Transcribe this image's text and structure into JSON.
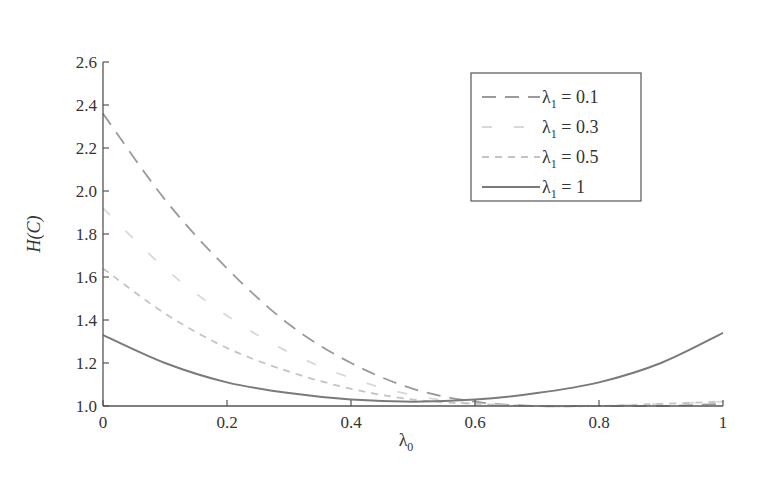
{
  "chart_data": {
    "type": "line",
    "title": "",
    "xlabel": "λ0",
    "ylabel": "H(C)",
    "xlim": [
      0,
      1
    ],
    "ylim": [
      1.0,
      2.6
    ],
    "grid": false,
    "legend_position": "upper right",
    "x_ticks": [
      "0",
      "0.2",
      "0.4",
      "0.6",
      "0.8",
      "1"
    ],
    "y_ticks": [
      "1.0",
      "1.2",
      "1.4",
      "1.6",
      "1.8",
      "2.0",
      "2.2",
      "2.4",
      "2.6"
    ],
    "x": [
      0,
      0.1,
      0.2,
      0.3,
      0.4,
      0.5,
      0.6,
      0.7,
      0.8,
      0.9,
      1.0
    ],
    "series": [
      {
        "name": "λ1 = 0.1",
        "style": "long-dash",
        "color": "#9a9a9a",
        "values": [
          2.36,
          1.96,
          1.64,
          1.38,
          1.2,
          1.08,
          1.02,
          1.0,
          1.0,
          1.0,
          1.01
        ]
      },
      {
        "name": "λ1 = 0.3",
        "style": "sparse-dash",
        "color": "#d8d8d8",
        "values": [
          1.92,
          1.64,
          1.42,
          1.25,
          1.13,
          1.05,
          1.01,
          1.0,
          1.0,
          1.01,
          1.02
        ]
      },
      {
        "name": "λ1 = 0.5",
        "style": "short-dash",
        "color": "#c4c4c4",
        "values": [
          1.64,
          1.43,
          1.27,
          1.16,
          1.08,
          1.03,
          1.01,
          1.0,
          1.0,
          1.01,
          1.02
        ]
      },
      {
        "name": "λ1 = 1",
        "style": "solid",
        "color": "#7a7a7a",
        "values": [
          1.33,
          1.2,
          1.11,
          1.06,
          1.03,
          1.02,
          1.03,
          1.06,
          1.11,
          1.2,
          1.34
        ]
      }
    ]
  },
  "legend": {
    "items": [
      {
        "label_main": "λ",
        "label_sub": "1",
        "label_rest": " = 0.1"
      },
      {
        "label_main": "λ",
        "label_sub": "1",
        "label_rest": " = 0.3"
      },
      {
        "label_main": "λ",
        "label_sub": "1",
        "label_rest": " = 0.5"
      },
      {
        "label_main": "λ",
        "label_sub": "1",
        "label_rest": " = 1"
      }
    ]
  },
  "axes": {
    "x_title_main": "λ",
    "x_title_sub": "0",
    "y_title": "H(C)"
  }
}
